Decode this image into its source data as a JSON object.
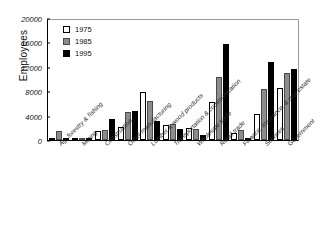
{
  "chart_data": {
    "type": "bar",
    "title": "",
    "xlabel": "",
    "ylabel": "Employees",
    "ylim": [
      0,
      20000
    ],
    "yticks": [
      0,
      4000,
      8000,
      12000,
      16000,
      20000
    ],
    "grid": false,
    "legend_position": "top-left",
    "categories": [
      "Ag, forestry & fishing",
      "Mining",
      "Construction",
      "Other manufacturing",
      "Lumber & wood products",
      "Transportation & communication",
      "Wholesale trade",
      "Retail trade",
      "Finance, insurance, & real estate",
      "Services",
      "Government"
    ],
    "series": [
      {
        "name": "1975",
        "color": "#ffffff",
        "values": [
          400,
          250,
          1400,
          2100,
          7800,
          2400,
          1900,
          6200,
          1100,
          4300,
          8600
        ]
      },
      {
        "name": "1985",
        "color": "#8c8c8c",
        "values": [
          1500,
          300,
          1600,
          4600,
          6400,
          2600,
          1800,
          10400,
          1700,
          8300,
          11000
        ]
      },
      {
        "name": "1995",
        "color": "#000000",
        "values": [
          300,
          200,
          3400,
          4800,
          3100,
          1800,
          900,
          15800,
          300,
          12800,
          11700
        ]
      }
    ]
  },
  "legend": {
    "items": [
      {
        "label": "1975"
      },
      {
        "label": "1985"
      },
      {
        "label": "1995"
      }
    ]
  }
}
